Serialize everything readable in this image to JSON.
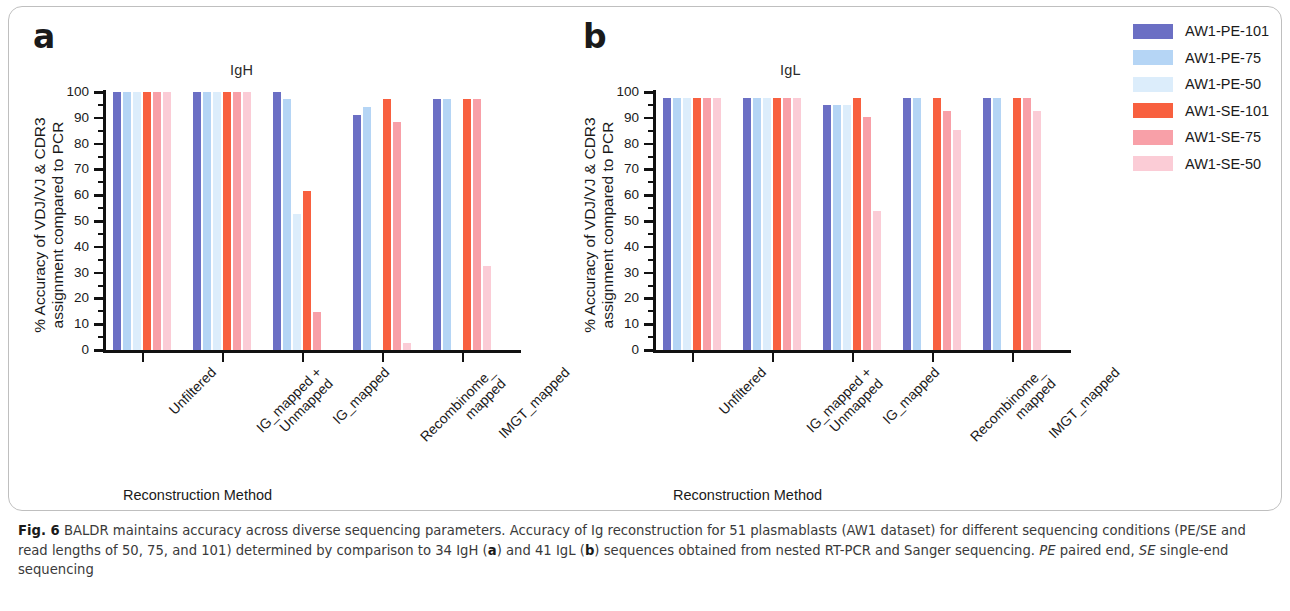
{
  "figure": {
    "letters": {
      "a": "a",
      "b": "b"
    },
    "y_axis_label_line1": "% Accuracy of VDJ/VJ & CDR3",
    "y_axis_label_line2": "assignment compared to PCR",
    "x_axis_caption": "Reconstruction Method"
  },
  "legend": {
    "items": [
      {
        "label": "AW1-PE-101",
        "color": "#6b6fc4"
      },
      {
        "label": "AW1-PE-75",
        "color": "#b5d5f5"
      },
      {
        "label": "AW1-PE-50",
        "color": "#dcedfb"
      },
      {
        "label": "AW1-SE-101",
        "color": "#f8603f"
      },
      {
        "label": "AW1-SE-75",
        "color": "#f8a0a8"
      },
      {
        "label": "AW1-SE-50",
        "color": "#fbccd6"
      }
    ]
  },
  "caption": {
    "fig_label": "Fig. 6",
    "text_1": " BALDR maintains accuracy across diverse sequencing parameters. Accuracy of Ig reconstruction for 51 plasmablasts (AW1 dataset) for different sequencing conditions (PE/SE and read lengths of 50, 75, and 101) determined by comparison to 34 IgH (",
    "bold_a": "a",
    "text_2": ") and 41 IgL (",
    "bold_b": "b",
    "text_3": ") sequences obtained from nested RT-PCR and Sanger sequencing. ",
    "italic_pe": "PE",
    "text_4": " paired end, ",
    "italic_se": "SE",
    "text_5": " single-end sequencing"
  },
  "chart_data": [
    {
      "panel": "a",
      "type": "bar",
      "title": "IgH",
      "xlabel": "Reconstruction Method",
      "ylabel": "% Accuracy of VDJ/VJ & CDR3 assignment compared to PCR",
      "ylim": [
        0,
        100
      ],
      "yticks": [
        0,
        10,
        20,
        30,
        40,
        50,
        60,
        70,
        80,
        90,
        100
      ],
      "grid": false,
      "legend_position": "right-outside",
      "categories": [
        "Unfiltered",
        "IG_mapped + Unmapped",
        "IG_mapped",
        "Recombinome_mapped",
        "IMGT_mapped"
      ],
      "series": [
        {
          "name": "AW1-PE-101",
          "color": "#6b6fc4",
          "values": [
            100,
            100,
            100,
            91.2,
            97.1
          ]
        },
        {
          "name": "AW1-PE-75",
          "color": "#b5d5f5",
          "values": [
            100,
            100,
            97.1,
            94.1,
            97.1
          ]
        },
        {
          "name": "AW1-PE-50",
          "color": "#dcedfb",
          "values": [
            100,
            100,
            52.9,
            0,
            0
          ]
        },
        {
          "name": "AW1-SE-101",
          "color": "#f8603f",
          "values": [
            100,
            100,
            61.8,
            97.1,
            97.1
          ]
        },
        {
          "name": "AW1-SE-75",
          "color": "#f8a0a8",
          "values": [
            100,
            100,
            14.7,
            88.2,
            97.1
          ]
        },
        {
          "name": "AW1-SE-50",
          "color": "#fbccd6",
          "values": [
            100,
            100,
            0,
            2.9,
            32.4
          ]
        }
      ]
    },
    {
      "panel": "b",
      "type": "bar",
      "title": "IgL",
      "xlabel": "Reconstruction Method",
      "ylabel": "% Accuracy of VDJ/VJ & CDR3 assignment compared to PCR",
      "ylim": [
        0,
        100
      ],
      "yticks": [
        0,
        10,
        20,
        30,
        40,
        50,
        60,
        70,
        80,
        90,
        100
      ],
      "grid": false,
      "legend_position": "right-outside",
      "categories": [
        "Unfiltered",
        "IG_mapped + Unmapped",
        "IG_mapped",
        "Recombinome_mapped",
        "IMGT_mapped"
      ],
      "series": [
        {
          "name": "AW1-PE-101",
          "color": "#6b6fc4",
          "values": [
            97.6,
            97.6,
            95.1,
            97.6,
            97.6
          ]
        },
        {
          "name": "AW1-PE-75",
          "color": "#b5d5f5",
          "values": [
            97.6,
            97.6,
            95.1,
            97.6,
            97.6
          ]
        },
        {
          "name": "AW1-PE-50",
          "color": "#dcedfb",
          "values": [
            97.6,
            97.6,
            95.1,
            0,
            0
          ]
        },
        {
          "name": "AW1-SE-101",
          "color": "#f8603f",
          "values": [
            97.6,
            97.6,
            97.6,
            97.6,
            97.6
          ]
        },
        {
          "name": "AW1-SE-75",
          "color": "#f8a0a8",
          "values": [
            97.6,
            97.6,
            90.2,
            92.7,
            97.6
          ]
        },
        {
          "name": "AW1-SE-50",
          "color": "#fbccd6",
          "values": [
            97.6,
            97.6,
            53.7,
            85.4,
            92.7
          ]
        }
      ]
    }
  ],
  "x_tick_labels": [
    {
      "line1": "Unfiltered",
      "line2": ""
    },
    {
      "line1": "IG_mapped +",
      "line2": "Unmapped"
    },
    {
      "line1": "IG_mapped",
      "line2": ""
    },
    {
      "line1": "Recombinome_",
      "line2": "mapped"
    },
    {
      "line1": "IMGT_mapped",
      "line2": ""
    }
  ]
}
